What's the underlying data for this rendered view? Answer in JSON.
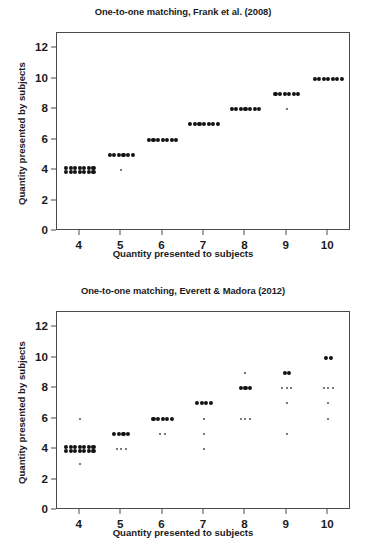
{
  "figure": {
    "width": 366,
    "height": 557,
    "background": "#ffffff",
    "dot_color": "#111111",
    "faint_dot_color": "#4f4f4f",
    "axis_color": "#4a4a4a"
  },
  "charts": [
    {
      "id": "frank-2008",
      "title": "One-to-one matching, Frank et al. (2008)",
      "xlabel": "Quantity presented to subjects",
      "ylabel": "Quantity presented by subjects",
      "xticks": [
        4,
        5,
        6,
        7,
        8,
        9,
        10
      ],
      "yticks": [
        0,
        2,
        4,
        6,
        8,
        10,
        12
      ],
      "xlim": [
        3.45,
        10.55
      ],
      "ylim": [
        0,
        13
      ],
      "grid": false,
      "legend": null
    },
    {
      "id": "everett-madora-2012",
      "title": "One-to-one matching, Everett & Madora (2012)",
      "xlabel": "Quantity presented to subjects",
      "ylabel": "Quantity presented by subjects",
      "xticks": [
        4,
        5,
        6,
        7,
        8,
        9,
        10
      ],
      "yticks": [
        0,
        2,
        4,
        6,
        8,
        10,
        12
      ],
      "xlim": [
        3.45,
        10.55
      ],
      "ylim": [
        0,
        13
      ],
      "grid": false,
      "legend": null
    }
  ],
  "chart_data": [
    {
      "type": "scatter",
      "id": "frank-2008",
      "title": "One-to-one matching, Frank et al. (2008)",
      "xlabel": "Quantity presented to subjects",
      "ylabel": "Quantity presented by subjects",
      "xlim": [
        3.45,
        10.55
      ],
      "ylim": [
        0,
        13
      ],
      "xticks": [
        4,
        5,
        6,
        7,
        8,
        9,
        10
      ],
      "yticks": [
        0,
        2,
        4,
        6,
        8,
        10,
        12
      ],
      "grid": false,
      "note": "Each point is one trial; points jittered horizontally within a column. count = number of overlapping trials at that (x,y).",
      "points": [
        {
          "x": 4,
          "y": 4.12,
          "count": 7,
          "weight": "strong"
        },
        {
          "x": 4,
          "y": 3.88,
          "count": 7,
          "weight": "strong"
        },
        {
          "x": 5,
          "y": 5.0,
          "count": 6,
          "weight": "strong"
        },
        {
          "x": 5,
          "y": 4.02,
          "count": 1,
          "weight": "faint"
        },
        {
          "x": 6,
          "y": 6.0,
          "count": 7,
          "weight": "strong"
        },
        {
          "x": 7,
          "y": 7.0,
          "count": 7,
          "weight": "strong"
        },
        {
          "x": 8,
          "y": 8.0,
          "count": 7,
          "weight": "strong"
        },
        {
          "x": 9,
          "y": 9.0,
          "count": 6,
          "weight": "strong"
        },
        {
          "x": 9,
          "y": 8.03,
          "count": 1,
          "weight": "faint"
        },
        {
          "x": 10,
          "y": 10.0,
          "count": 7,
          "weight": "strong"
        }
      ]
    },
    {
      "type": "scatter",
      "id": "everett-madora-2012",
      "title": "One-to-one matching, Everett & Madora (2012)",
      "xlabel": "Quantity presented to subjects",
      "ylabel": "Quantity presented by subjects",
      "xlim": [
        3.45,
        10.55
      ],
      "ylim": [
        0,
        13
      ],
      "xticks": [
        4,
        5,
        6,
        7,
        8,
        9,
        10
      ],
      "yticks": [
        0,
        2,
        4,
        6,
        8,
        10,
        12
      ],
      "grid": false,
      "note": "Each point is one trial; points jittered horizontally within a column. count = number of overlapping trials at that (x,y).",
      "points": [
        {
          "x": 4,
          "y": 6.0,
          "count": 1,
          "weight": "faint"
        },
        {
          "x": 4,
          "y": 4.12,
          "count": 7,
          "weight": "strong"
        },
        {
          "x": 4,
          "y": 3.88,
          "count": 7,
          "weight": "strong"
        },
        {
          "x": 4,
          "y": 3.0,
          "count": 1,
          "weight": "faint"
        },
        {
          "x": 5,
          "y": 5.0,
          "count": 4,
          "weight": "strong"
        },
        {
          "x": 5,
          "y": 4.0,
          "count": 3,
          "weight": "faint"
        },
        {
          "x": 6,
          "y": 6.0,
          "count": 5,
          "weight": "strong"
        },
        {
          "x": 6,
          "y": 5.0,
          "count": 2,
          "weight": "faint"
        },
        {
          "x": 7,
          "y": 7.0,
          "count": 4,
          "weight": "strong"
        },
        {
          "x": 7,
          "y": 6.0,
          "count": 1,
          "weight": "faint"
        },
        {
          "x": 7,
          "y": 5.0,
          "count": 1,
          "weight": "faint"
        },
        {
          "x": 7,
          "y": 4.0,
          "count": 1,
          "weight": "faint"
        },
        {
          "x": 8,
          "y": 9.0,
          "count": 1,
          "weight": "faint"
        },
        {
          "x": 8,
          "y": 8.0,
          "count": 3,
          "weight": "strong"
        },
        {
          "x": 8,
          "y": 6.0,
          "count": 3,
          "weight": "faint"
        },
        {
          "x": 9,
          "y": 9.0,
          "count": 2,
          "weight": "strong"
        },
        {
          "x": 9,
          "y": 8.0,
          "count": 3,
          "weight": "faint"
        },
        {
          "x": 9,
          "y": 7.0,
          "count": 1,
          "weight": "faint"
        },
        {
          "x": 9,
          "y": 5.0,
          "count": 1,
          "weight": "faint"
        },
        {
          "x": 10,
          "y": 10.0,
          "count": 2,
          "weight": "strong"
        },
        {
          "x": 10,
          "y": 8.0,
          "count": 3,
          "weight": "faint"
        },
        {
          "x": 10,
          "y": 7.0,
          "count": 1,
          "weight": "faint"
        },
        {
          "x": 10,
          "y": 6.0,
          "count": 1,
          "weight": "faint"
        }
      ]
    }
  ]
}
